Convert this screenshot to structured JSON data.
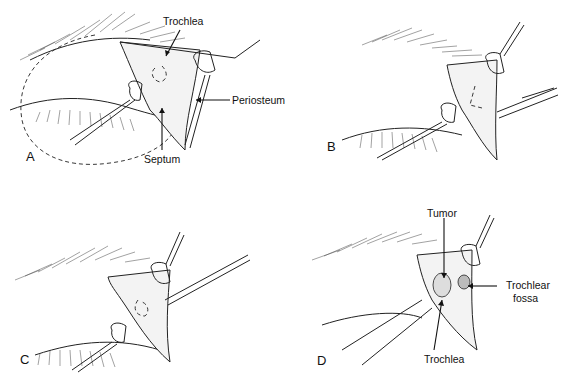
{
  "figure": {
    "panels": [
      {
        "id": "A",
        "letter": "A",
        "labels": {
          "trochlea": "Trochlea",
          "periosteum": "Periosteum",
          "septum": "Septum"
        }
      },
      {
        "id": "B",
        "letter": "B",
        "labels": {}
      },
      {
        "id": "C",
        "letter": "C",
        "labels": {}
      },
      {
        "id": "D",
        "letter": "D",
        "labels": {
          "tumor": "Tumor",
          "trochlear_fossa_line1": "Trochlear",
          "trochlear_fossa_line2": "fossa",
          "trochlea": "Trochlea"
        }
      }
    ],
    "colors": {
      "ink": "#222222",
      "background": "#ffffff"
    }
  }
}
